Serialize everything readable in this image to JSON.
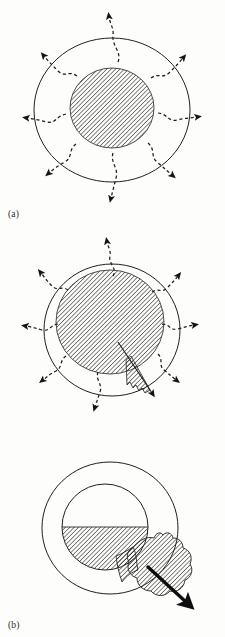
{
  "figure": {
    "type": "schematic-diagram",
    "background_color": "#fdfdfc",
    "line_color": "#1a1a1a",
    "hatch_color": "#2a2a2a",
    "panel_count": 3
  },
  "panels": [
    {
      "id": "a",
      "label": "(a)",
      "caption_text": "(a)",
      "stage": "initial",
      "outer_boundary": {
        "shape": "circle",
        "center_x": 112,
        "center_y": 110,
        "radius_x": 78,
        "radius_y": 72,
        "stroke_width": 1,
        "fill": "none"
      },
      "core": {
        "shape": "circle",
        "center_x": 112,
        "center_y": 108,
        "radius_x": 42,
        "radius_y": 40,
        "fill": "hatched",
        "hatch_angle_degrees": 45
      },
      "arrows": {
        "count": 8,
        "style": "dashed-wavy",
        "head": "solid-triangle",
        "direction": "outward-radial",
        "description": "eight dashed wavy arrows radiating outward across the boundary"
      }
    },
    {
      "id": "b",
      "label": "(b)",
      "caption_text": "(b)",
      "stage": "swollen",
      "outer_boundary": {
        "shape": "circle",
        "center_x": 112,
        "center_y": 330,
        "radius_x": 68,
        "radius_y": 66,
        "stroke_width": 1,
        "fill": "none"
      },
      "core": {
        "shape": "circle",
        "center_x": 110,
        "center_y": 322,
        "radius_x": 54,
        "radius_y": 52,
        "fill": "hatched",
        "hatch_angle_degrees": 45
      },
      "protrusion": {
        "shape": "narrow-wedge",
        "fill": "hatched",
        "edge": "jagged",
        "direction": "lower-right",
        "description": "thin hatched spike emerging from the core toward the lower-right boundary"
      },
      "arrows": {
        "count": 8,
        "style": "dashed-wavy",
        "head": "solid-triangle",
        "direction": "outward-radial",
        "description": "eight dashed wavy arrows radiating outward; one thin straight arrow follows the wedge"
      }
    },
    {
      "id": "c",
      "label": "(c)",
      "caption_text": "(c)",
      "stage": "rupture",
      "outer_boundary": {
        "shape": "circle",
        "center_x": 110,
        "center_y": 528,
        "radius_x": 68,
        "radius_y": 66,
        "stroke_width": 1,
        "fill": "none"
      },
      "inner_boundary": {
        "shape": "circle",
        "center_x": 105,
        "center_y": 527,
        "radius_x": 43,
        "radius_y": 43,
        "stroke_width": 1,
        "fill": "none"
      },
      "core": {
        "shape": "partial-circle",
        "fill": "hatched",
        "fill_level": "lower-half",
        "fill_boundary": "horizontal",
        "hatch_angle_degrees": 45,
        "description": "only the lower portion of the inner circle is hatched, bounded by a horizontal line"
      },
      "breakthrough_blob": {
        "shape": "irregular-lobe",
        "fill": "hatched",
        "edge": "jagged",
        "direction": "lower-right",
        "crosses_outer_boundary": true,
        "description": "large hatched lobe bursting through the outer boundary at the lower right"
      },
      "arrow": {
        "style": "solid-thick",
        "head": "solid-triangle",
        "direction": "lower-right",
        "color": "#111111",
        "description": "bold solid arrow directed out of the ruptured lobe"
      }
    }
  ]
}
